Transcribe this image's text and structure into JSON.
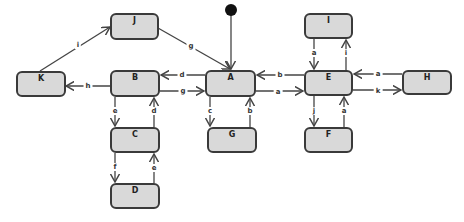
{
  "diagram": {
    "type": "state-machine",
    "colors": {
      "node_fill": "#d9d9d9",
      "node_border": "#3a3a3a",
      "edge": "#444444",
      "initial": "#111111"
    },
    "nodes": {
      "J": "J",
      "K": "K",
      "B": "B",
      "A": "A",
      "C": "C",
      "D": "D",
      "G": "G",
      "I": "I",
      "E": "E",
      "F": "F",
      "H": "H"
    },
    "edges": [
      {
        "from": "K",
        "to": "J",
        "label": "i"
      },
      {
        "from": "J",
        "to": "A",
        "label": "g"
      },
      {
        "from": "A",
        "to": "B",
        "label": "d"
      },
      {
        "from": "B",
        "to": "A",
        "label": "g"
      },
      {
        "from": "B",
        "to": "K",
        "label": "h"
      },
      {
        "from": "B",
        "to": "C",
        "label": "e"
      },
      {
        "from": "C",
        "to": "B",
        "label": "d"
      },
      {
        "from": "C",
        "to": "D",
        "label": "f"
      },
      {
        "from": "D",
        "to": "C",
        "label": "e"
      },
      {
        "from": "A",
        "to": "G",
        "label": "c"
      },
      {
        "from": "G",
        "to": "A",
        "label": "b"
      },
      {
        "from": "E",
        "to": "A",
        "label": "b"
      },
      {
        "from": "A",
        "to": "E",
        "label": "a"
      },
      {
        "from": "I",
        "to": "E",
        "label": "a"
      },
      {
        "from": "E",
        "to": "I",
        "label": "i"
      },
      {
        "from": "H",
        "to": "E",
        "label": "a"
      },
      {
        "from": "E",
        "to": "H",
        "label": "k"
      },
      {
        "from": "E",
        "to": "F",
        "label": "j"
      },
      {
        "from": "F",
        "to": "E",
        "label": "a"
      }
    ],
    "initial_state": "A"
  }
}
